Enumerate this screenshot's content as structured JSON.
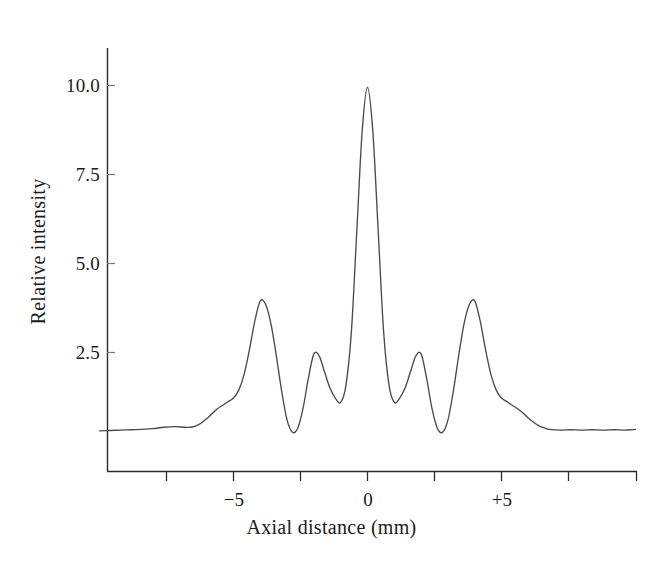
{
  "figure": {
    "background_color": "#ffffff",
    "line_color": "#4a4a4a",
    "axis_color": "#2b2b2b"
  },
  "axis": {
    "x_title": "Axial distance (mm)",
    "y_title": "Relative intensity",
    "x_tick_labels": [
      "−5",
      "0",
      "+5"
    ],
    "y_tick_labels": [
      "10.0",
      "7.5",
      "5.0",
      "2.5"
    ]
  },
  "chart_data": {
    "type": "line",
    "title": "",
    "xlabel": "Axial distance (mm)",
    "ylabel": "Relative intensity",
    "xlim": [
      -10,
      10
    ],
    "ylim": [
      0,
      11.5
    ],
    "xticks": [
      -7.5,
      -5,
      -2.5,
      0,
      2.5,
      5,
      7.5,
      10
    ],
    "xticklabels": [
      "",
      "−5",
      "",
      "0",
      "",
      "+5",
      "",
      ""
    ],
    "yticks": [
      2.5,
      5.0,
      7.5,
      10.0
    ],
    "yticklabels": [
      "2.5",
      "5.0",
      "7.5",
      "10.0"
    ],
    "grid": false,
    "legend": null,
    "series": [
      {
        "name": "Beam profile",
        "x": [
          -10.0,
          -9.6,
          -9.2,
          -8.8,
          -8.4,
          -8.0,
          -7.6,
          -7.2,
          -6.8,
          -6.6,
          -6.4,
          -6.2,
          -6.0,
          -5.8,
          -5.6,
          -5.4,
          -5.2,
          -5.0,
          -4.8,
          -4.6,
          -4.4,
          -4.2,
          -4.0,
          -3.8,
          -3.6,
          -3.4,
          -3.2,
          -3.0,
          -2.8,
          -2.6,
          -2.4,
          -2.2,
          -2.0,
          -1.8,
          -1.6,
          -1.4,
          -1.2,
          -1.0,
          -0.8,
          -0.6,
          -0.4,
          -0.2,
          0.0,
          0.2,
          0.4,
          0.6,
          0.8,
          1.0,
          1.2,
          1.4,
          1.6,
          1.8,
          2.0,
          2.2,
          2.4,
          2.6,
          2.8,
          3.0,
          3.2,
          3.4,
          3.6,
          3.8,
          4.0,
          4.2,
          4.4,
          4.6,
          4.8,
          5.0,
          5.2,
          5.4,
          5.6,
          5.8,
          6.0,
          6.2,
          6.4,
          6.6,
          6.8,
          7.2,
          7.6,
          8.0,
          8.4,
          8.8,
          9.2,
          9.6,
          10.0
        ],
        "y": [
          0.3,
          0.31,
          0.32,
          0.33,
          0.34,
          0.36,
          0.4,
          0.42,
          0.4,
          0.4,
          0.44,
          0.52,
          0.64,
          0.78,
          0.92,
          1.02,
          1.12,
          1.22,
          1.45,
          1.9,
          2.6,
          3.4,
          3.95,
          3.85,
          3.3,
          2.4,
          1.4,
          0.6,
          0.26,
          0.38,
          0.95,
          1.8,
          2.46,
          2.4,
          1.95,
          1.5,
          1.22,
          1.1,
          1.6,
          3.1,
          5.9,
          8.7,
          9.95,
          8.7,
          5.9,
          3.1,
          1.6,
          1.1,
          1.22,
          1.5,
          1.95,
          2.4,
          2.46,
          1.8,
          0.95,
          0.38,
          0.26,
          0.6,
          1.4,
          2.4,
          3.3,
          3.85,
          3.95,
          3.4,
          2.6,
          1.9,
          1.45,
          1.22,
          1.12,
          1.02,
          0.92,
          0.8,
          0.66,
          0.54,
          0.44,
          0.38,
          0.34,
          0.32,
          0.33,
          0.32,
          0.33,
          0.32,
          0.33,
          0.32,
          0.34
        ],
        "peaks": [
          {
            "x": -4.0,
            "y": 4.0
          },
          {
            "x": -2.0,
            "y": 2.5
          },
          {
            "x": 0.0,
            "y": 10.0
          },
          {
            "x": 2.0,
            "y": 2.5
          },
          {
            "x": 4.0,
            "y": 4.0
          }
        ],
        "minima": [
          {
            "x": -3.0,
            "y": 0.25
          },
          {
            "x": -1.0,
            "y": 1.1
          },
          {
            "x": 1.0,
            "y": 1.1
          },
          {
            "x": 3.0,
            "y": 0.25
          }
        ],
        "baseline": 0.32
      }
    ]
  }
}
